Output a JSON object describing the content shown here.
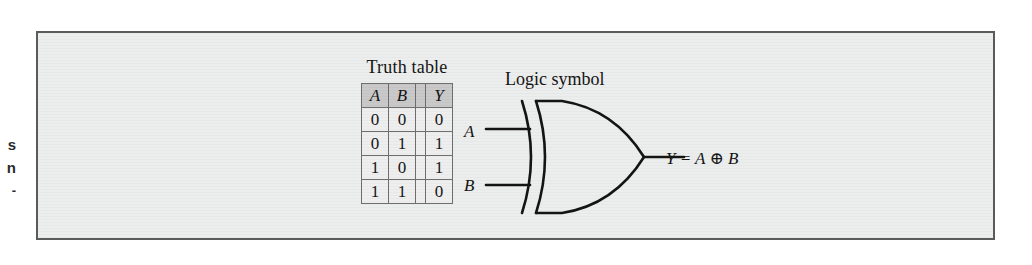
{
  "page_margin_fragments": [
    "s",
    "n",
    "-"
  ],
  "figure": {
    "truth_table": {
      "caption": "Truth table",
      "headers": [
        "A",
        "B",
        "Y"
      ],
      "rows": [
        [
          "0",
          "0",
          "0"
        ],
        [
          "0",
          "1",
          "1"
        ],
        [
          "1",
          "0",
          "1"
        ],
        [
          "1",
          "1",
          "0"
        ]
      ]
    },
    "logic_symbol": {
      "caption": "Logic symbol",
      "gate_type": "XOR",
      "input_labels": [
        "A",
        "B"
      ],
      "output_expression": "Y = A ⊕ B"
    },
    "colors": {
      "panel_background": "#eceded",
      "panel_border": "#5a5a5a",
      "header_fill": "#c9c9c9",
      "cell_fill": "#eeeeee",
      "grid_line": "#6e6e6e",
      "ink": "#141414"
    }
  }
}
